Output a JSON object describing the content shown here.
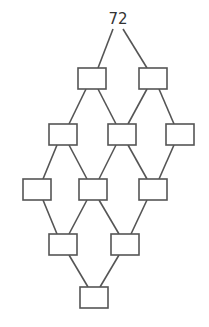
{
  "diagram": {
    "type": "factor-tree-lattice",
    "root": {
      "id": "root",
      "label": "72",
      "x": 118,
      "y": 24
    },
    "colors": {
      "line": "#555555",
      "box_fill": "#ffffff",
      "text": "#333333"
    },
    "box_size": {
      "w": 28,
      "h": 21
    },
    "nodes": [
      {
        "id": "r1a",
        "label": "",
        "x": 78,
        "y": 68
      },
      {
        "id": "r1b",
        "label": "",
        "x": 139,
        "y": 68
      },
      {
        "id": "r2a",
        "label": "",
        "x": 49,
        "y": 124
      },
      {
        "id": "r2b",
        "label": "",
        "x": 108,
        "y": 124
      },
      {
        "id": "r2c",
        "label": "",
        "x": 166,
        "y": 124
      },
      {
        "id": "r3a",
        "label": "",
        "x": 23,
        "y": 179
      },
      {
        "id": "r3b",
        "label": "",
        "x": 79,
        "y": 179
      },
      {
        "id": "r3c",
        "label": "",
        "x": 139,
        "y": 179
      },
      {
        "id": "r4a",
        "label": "",
        "x": 49,
        "y": 234
      },
      {
        "id": "r4b",
        "label": "",
        "x": 111,
        "y": 234
      },
      {
        "id": "r5a",
        "label": "",
        "x": 80,
        "y": 287
      }
    ],
    "edges": [
      [
        "root",
        "r1a"
      ],
      [
        "root",
        "r1b"
      ],
      [
        "r1a",
        "r2a"
      ],
      [
        "r1a",
        "r2b"
      ],
      [
        "r1b",
        "r2b"
      ],
      [
        "r1b",
        "r2c"
      ],
      [
        "r2a",
        "r3a"
      ],
      [
        "r2a",
        "r3b"
      ],
      [
        "r2b",
        "r3b"
      ],
      [
        "r2b",
        "r3c"
      ],
      [
        "r2c",
        "r3c"
      ],
      [
        "r3a",
        "r4a"
      ],
      [
        "r3b",
        "r4a"
      ],
      [
        "r3b",
        "r4b"
      ],
      [
        "r3c",
        "r4b"
      ],
      [
        "r4a",
        "r5a"
      ],
      [
        "r4b",
        "r5a"
      ]
    ]
  }
}
